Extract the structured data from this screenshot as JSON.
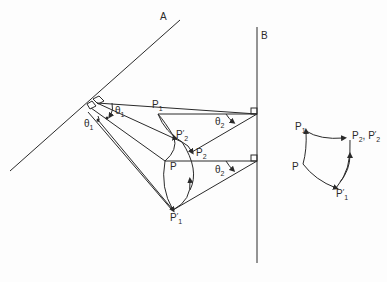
{
  "diagram": {
    "lines": {
      "A": {
        "label": "A"
      },
      "B": {
        "label": "B"
      }
    },
    "angles": {
      "theta1_a": {
        "base": "θ",
        "sub": "1"
      },
      "theta1_b": {
        "base": "θ",
        "sub": "1"
      },
      "theta2_a": {
        "base": "θ",
        "sub": "2"
      },
      "theta2_b": {
        "base": "θ",
        "sub": "2"
      }
    },
    "points": {
      "P1": {
        "base": "P",
        "sub": "1"
      },
      "P": {
        "base": "P"
      },
      "P2": {
        "base": "P",
        "sub": "2"
      },
      "P2_prime": {
        "base": "P",
        "sup": "′",
        "sub": "2"
      },
      "P1_prime": {
        "base": "P",
        "sup": "′",
        "sub": "1"
      }
    },
    "inset": {
      "P1": {
        "base": "P",
        "sub": "1"
      },
      "P": {
        "base": "P"
      },
      "P2P2prime": {
        "text": "P",
        "sub": "2",
        "sep": ", P",
        "sup2": "′",
        "sub2": "2"
      },
      "P1_prime": {
        "base": "P",
        "sup": "′",
        "sub": "1"
      }
    },
    "colors": {
      "stroke": "#2a2a2a",
      "background": "#fdfdfd"
    }
  }
}
